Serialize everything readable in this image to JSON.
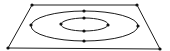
{
  "diagram": {
    "colors": {
      "background": "#ffffff",
      "stroke": "#1a1a1a",
      "point": "#111111"
    },
    "quadrilateral": {
      "vertices": [
        {
          "id": "top-left",
          "x": 32,
          "y": 5
        },
        {
          "id": "top-right",
          "x": 137,
          "y": 5
        },
        {
          "id": "bottom-right",
          "x": 160,
          "y": 49
        },
        {
          "id": "bottom-left",
          "x": 8,
          "y": 48
        }
      ]
    },
    "ellipses": [
      {
        "id": "outer",
        "cx": 84.5,
        "cy": 26,
        "rx": 53.5,
        "ry": 15,
        "points": [
          {
            "id": "outer-top",
            "x": 84,
            "y": 11
          },
          {
            "id": "outer-left",
            "x": 31,
            "y": 25
          },
          {
            "id": "outer-right",
            "x": 138,
            "y": 26
          },
          {
            "id": "outer-bottom",
            "x": 84,
            "y": 41
          }
        ]
      },
      {
        "id": "inner",
        "cx": 84.5,
        "cy": 24.5,
        "rx": 23.5,
        "ry": 6.5,
        "points": [
          {
            "id": "inner-top",
            "x": 84,
            "y": 18
          },
          {
            "id": "inner-left",
            "x": 61,
            "y": 24
          },
          {
            "id": "inner-right",
            "x": 108,
            "y": 25
          },
          {
            "id": "inner-bottom",
            "x": 84,
            "y": 31
          }
        ]
      }
    ]
  }
}
